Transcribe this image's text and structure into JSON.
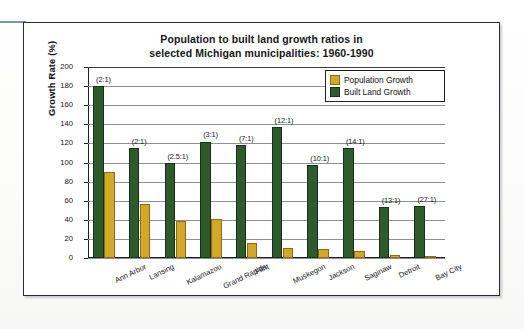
{
  "figure": {
    "title_line1": "Population to built land growth ratios in",
    "title_line2": "selected Michigan municipalities: 1960-1990"
  },
  "legend": {
    "position": "top-right",
    "items": [
      {
        "label": "Population Growth",
        "color": "#d3a828",
        "key": "population"
      },
      {
        "label": "Built Land Growth",
        "color": "#2d5b2b",
        "key": "built_land"
      }
    ]
  },
  "axes": {
    "y_title": "Growth Rate (%)",
    "y_ticks": [
      "200",
      "180",
      "160",
      "140",
      "120",
      "100",
      "80",
      "60",
      "40",
      "20",
      "0"
    ],
    "x_title": ""
  },
  "chart_data": {
    "type": "bar",
    "title": "Population to built land growth ratios in selected Michigan municipalities: 1960-1990",
    "xlabel": "",
    "ylabel": "Growth Rate (%)",
    "ylim": [
      0,
      200
    ],
    "ytick_step": 20,
    "grid": true,
    "legend_position": "top-right",
    "categories": [
      "Ann Arbor",
      "Lansing",
      "Kalamazoo",
      "Grand Rapids",
      "Flint",
      "Muskegon",
      "Jackson",
      "Saginaw",
      "Detroit",
      "Bay City"
    ],
    "series": [
      {
        "name": "Population Growth",
        "color": "#d3a828",
        "values": [
          90,
          57,
          39,
          41,
          16,
          11,
          9,
          7,
          3,
          1.5
        ]
      },
      {
        "name": "Built Land Growth",
        "color": "#2d5b2b",
        "values": [
          180,
          115,
          100,
          122,
          118,
          137,
          97,
          115,
          53,
          54
        ]
      }
    ],
    "annotations": [
      {
        "category": "Ann Arbor",
        "text": "(2:1)"
      },
      {
        "category": "Lansing",
        "text": "(2:1)"
      },
      {
        "category": "Kalamazoo",
        "text": "(2.5:1)"
      },
      {
        "category": "Grand Rapids",
        "text": "(3:1)"
      },
      {
        "category": "Flint",
        "text": "(7:1)"
      },
      {
        "category": "Muskegon",
        "text": "(12:1)"
      },
      {
        "category": "Jackson",
        "text": "(10:1)"
      },
      {
        "category": "Saginaw",
        "text": "(14:1)"
      },
      {
        "category": "Detroit",
        "text": "(13:1)"
      },
      {
        "category": "Bay City",
        "text": "(27:1)"
      }
    ]
  }
}
